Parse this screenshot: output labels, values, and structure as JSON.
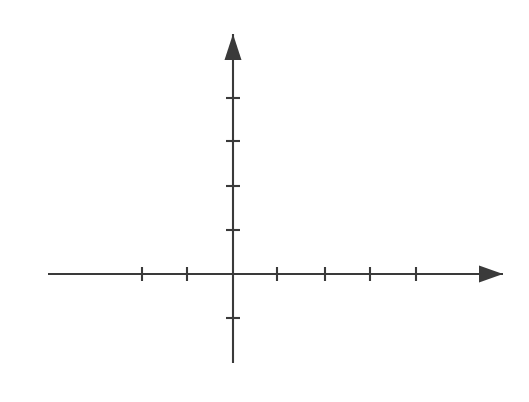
{
  "figure": {
    "kind": "coordinate-axes-diagram",
    "width": 529,
    "height": 402,
    "background_color": "#ffffff",
    "stroke_color": "#3a3a3a",
    "axis_line_width": 2.1,
    "tick_line_width": 2.1,
    "appearance": "scanned photocopy, soft gray strokes, no labels"
  },
  "chart_data": {
    "type": "scatter",
    "title": "",
    "subtitle": "",
    "xlabel": "",
    "ylabel": "",
    "series": [],
    "x": [],
    "values": [],
    "grid": false,
    "legend": "none",
    "annotations": [],
    "xlim": [
      -4,
      7
    ],
    "ylim": [
      -2,
      6
    ],
    "xtick_labels": [],
    "ytick_labels": [],
    "origin_px": {
      "x": 233,
      "y": 274
    },
    "unit_px": {
      "x": 45.4,
      "y": 44.0
    },
    "x_axis": {
      "start_px": 48,
      "end_px": 503,
      "y_px": 274,
      "arrow_at": "right",
      "arrow_tip_px": 503,
      "tick_half_length_px": 7,
      "ticks_px": [
        142,
        187,
        277,
        325,
        370,
        416
      ],
      "ticks_units": [
        -2,
        -1,
        1,
        2,
        3,
        4
      ]
    },
    "y_axis": {
      "start_px": 363,
      "end_px": 34,
      "x_px": 233,
      "arrow_at": "top",
      "arrow_tip_px": 34,
      "tick_half_length_px": 7,
      "ticks_px": [
        98,
        141,
        186,
        230,
        318
      ],
      "ticks_units": [
        4,
        3,
        2,
        1,
        -1
      ]
    },
    "arrowheads": [
      {
        "name": "y-axis-arrowhead",
        "direction": "up",
        "tip_x": 233,
        "tip_y": 34,
        "width": 17,
        "height": 26
      },
      {
        "name": "x-axis-arrowhead",
        "direction": "right",
        "tip_x": 503,
        "tip_y": 274,
        "width": 24,
        "height": 17
      }
    ]
  }
}
